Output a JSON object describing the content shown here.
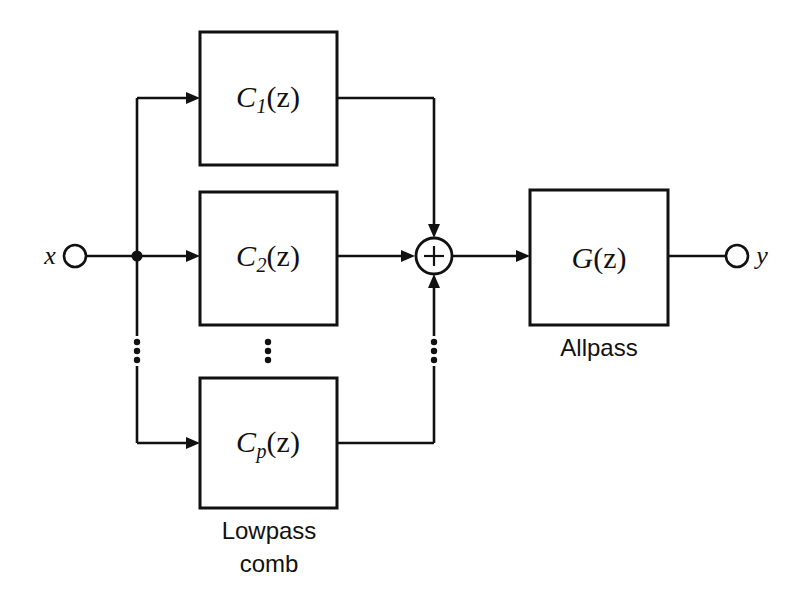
{
  "diagram": {
    "type": "block-diagram",
    "canvas": {
      "width": 798,
      "height": 596,
      "background": "#ffffff"
    },
    "stroke_color": "#111111",
    "input": {
      "name": "x",
      "label": "x"
    },
    "output": {
      "name": "y",
      "label": "y"
    },
    "summer": {
      "label": "+",
      "operation": "sum"
    },
    "blocks": [
      {
        "id": "c1",
        "base": "C",
        "subscript": "1",
        "arg": "(z)",
        "label": "C1(z)"
      },
      {
        "id": "c2",
        "base": "C",
        "subscript": "2",
        "arg": "(z)",
        "label": "C2(z)"
      },
      {
        "id": "cp",
        "base": "C",
        "subscript": "p",
        "arg": "(z)",
        "label": "Cp(z)"
      },
      {
        "id": "g",
        "base": "G",
        "subscript": "",
        "arg": "(z)",
        "label": "G(z)"
      }
    ],
    "captions": {
      "comb_line1": "Lowpass",
      "comb_line2": "comb",
      "allpass": "Allpass"
    },
    "ellipsis": {
      "glyph": "⋮",
      "count": 3,
      "positions": [
        "input-bus",
        "between-blocks",
        "output-bus"
      ]
    }
  }
}
